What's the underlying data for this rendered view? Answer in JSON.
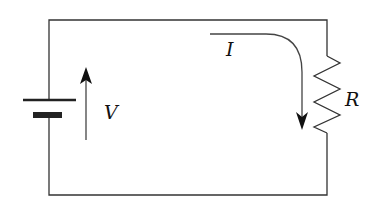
{
  "diagram": {
    "type": "circuit",
    "components": [
      {
        "id": "battery",
        "kind": "voltage-source",
        "label": "V"
      },
      {
        "id": "resistor",
        "kind": "resistor",
        "label": "R"
      }
    ],
    "labels": {
      "voltage": "V",
      "current": "I",
      "resistance": "R"
    },
    "colors": {
      "wire": "#333333",
      "text": "#111111",
      "background": "#ffffff"
    }
  }
}
